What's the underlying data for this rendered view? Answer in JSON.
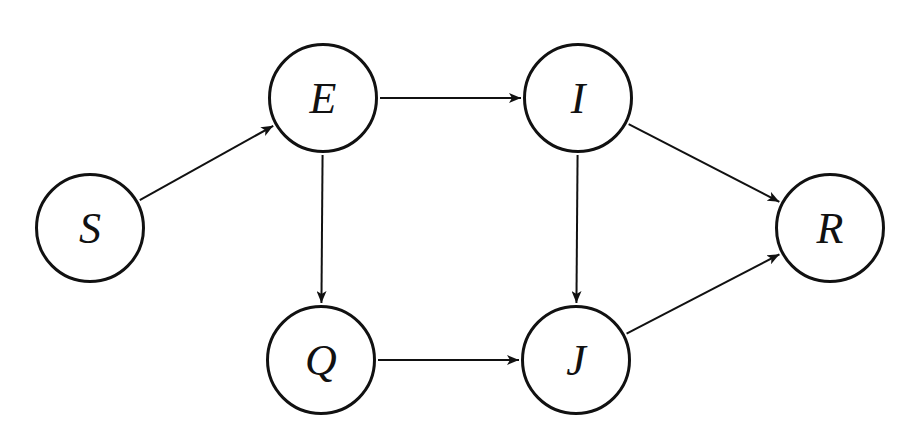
{
  "diagram": {
    "type": "directed-graph",
    "stroke_color": "#111111",
    "background": "#ffffff",
    "nodes": [
      {
        "id": "S",
        "label": "S",
        "cx": 90,
        "cy": 228
      },
      {
        "id": "E",
        "label": "E",
        "cx": 323,
        "cy": 98
      },
      {
        "id": "I",
        "label": "I",
        "cx": 578,
        "cy": 98
      },
      {
        "id": "Q",
        "label": "Q",
        "cx": 321,
        "cy": 360
      },
      {
        "id": "J",
        "label": "J",
        "cx": 576,
        "cy": 360
      },
      {
        "id": "R",
        "label": "R",
        "cx": 830,
        "cy": 228
      }
    ],
    "edges": [
      {
        "from": "S",
        "to": "E"
      },
      {
        "from": "E",
        "to": "I"
      },
      {
        "from": "E",
        "to": "Q"
      },
      {
        "from": "I",
        "to": "J"
      },
      {
        "from": "I",
        "to": "R"
      },
      {
        "from": "Q",
        "to": "J"
      },
      {
        "from": "J",
        "to": "R"
      }
    ],
    "node_radius": 57
  }
}
